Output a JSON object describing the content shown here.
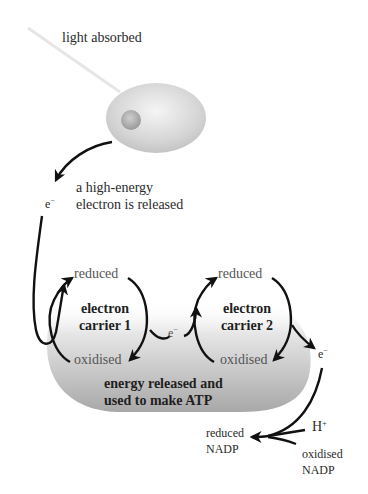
{
  "colors": {
    "arrow": "#111111",
    "light_ray": "#e8e8e8",
    "band_dark": "#a9a9a9",
    "band_light": "#f4f4f4",
    "chlorophyll_outer": "#d8d8d8",
    "chlorophyll_core": "#a0a0a0"
  },
  "labels": {
    "light": "light absorbed",
    "electron_released_line1": "a high-energy",
    "electron_released_line2": "electron is released",
    "electron_symbol": "e",
    "electron_charge": "−",
    "carrier1_reduced": "reduced",
    "carrier1_oxidised": "oxidised",
    "carrier1_name_line1": "electron",
    "carrier1_name_line2": "carrier 1",
    "carrier2_reduced": "reduced",
    "carrier2_oxidised": "oxidised",
    "carrier2_name_line1": "electron",
    "carrier2_name_line2": "carrier 2",
    "energy_line1": "energy released and",
    "energy_line2": "used to make ATP",
    "hydrogen_symbol": "H",
    "hydrogen_charge": "+",
    "nadp_reduced_line1": "reduced",
    "nadp_reduced_line2": "NADP",
    "nadp_oxidised_line1": "oxidised",
    "nadp_oxidised_line2": "NADP"
  }
}
